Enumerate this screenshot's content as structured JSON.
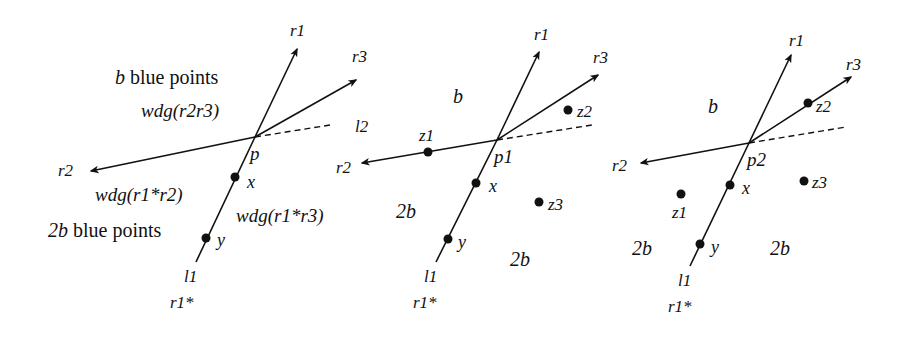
{
  "figure": {
    "background": "#ffffff",
    "ink": "#111111",
    "panels": [
      {
        "id": "panel-1",
        "apex": {
          "label": "p",
          "x": 255,
          "y": 137
        },
        "rays": [
          {
            "label": "r1",
            "tip": [
              297,
              49
            ]
          },
          {
            "label": "r3",
            "tip": [
              356,
              80
            ]
          },
          {
            "label": "r2",
            "tip": [
              91,
              171
            ]
          }
        ],
        "dashed": {
          "label": "l2",
          "end": [
            330,
            125
          ]
        },
        "line_l1": {
          "label": "l1",
          "end": [
            196,
            262
          ],
          "sub_label": "r1*"
        },
        "points": [
          {
            "label": "x",
            "x": 235,
            "y": 177
          },
          {
            "label": "y",
            "x": 206,
            "y": 238
          }
        ],
        "region_texts": [
          {
            "italic": "b",
            "text": " blue points",
            "x": 115,
            "y": 84
          },
          {
            "text": "wdg(r2r3)",
            "x": 141,
            "y": 117
          },
          {
            "text": "wdg(r1*r2)",
            "x": 95,
            "y": 201
          },
          {
            "italic": "2b",
            "text": " blue points",
            "x": 48,
            "y": 237
          },
          {
            "text": "wdg(r1*r3)",
            "x": 236,
            "y": 222
          }
        ]
      },
      {
        "id": "panel-2",
        "apex": {
          "label": "p1",
          "x": 497,
          "y": 140
        },
        "rays": [
          {
            "label": "r1",
            "tip": [
              539,
              52
            ]
          },
          {
            "label": "r3",
            "tip": [
              598,
              75
            ]
          },
          {
            "label": "r2",
            "tip": [
              362,
              163
            ]
          }
        ],
        "dashed": {
          "end": [
            592,
            125
          ]
        },
        "line_l1": {
          "label": "l1",
          "end": [
            436,
            262
          ],
          "sub_label": "r1*"
        },
        "points": [
          {
            "label": "x",
            "x": 476,
            "y": 183
          },
          {
            "label": "y",
            "x": 448,
            "y": 239
          },
          {
            "label": "z1",
            "x": 428,
            "y": 152
          },
          {
            "label": "z2",
            "x": 568,
            "y": 110
          },
          {
            "label": "z3",
            "x": 539,
            "y": 202
          }
        ],
        "region_texts": [
          {
            "text": "b",
            "x": 453,
            "y": 103
          },
          {
            "text": "2b",
            "x": 396,
            "y": 218
          },
          {
            "text": "2b",
            "x": 510,
            "y": 266
          }
        ]
      },
      {
        "id": "panel-3",
        "apex": {
          "label": "p2",
          "x": 749,
          "y": 143
        },
        "rays": [
          {
            "label": "r1",
            "tip": [
              791,
              55
            ]
          },
          {
            "label": "r3",
            "tip": [
              851,
              77
            ]
          },
          {
            "label": "r2",
            "tip": [
              641,
              163
            ]
          }
        ],
        "dashed": {
          "end": [
            846,
            127
          ]
        },
        "line_l1": {
          "label": "l1",
          "end": [
            690,
            266
          ],
          "sub_label": "r1*"
        },
        "points": [
          {
            "label": "x",
            "x": 730,
            "y": 185
          },
          {
            "label": "y",
            "x": 700,
            "y": 244
          },
          {
            "label": "z1",
            "x": 681,
            "y": 194
          },
          {
            "label": "z2",
            "x": 808,
            "y": 103
          },
          {
            "label": "z3",
            "x": 804,
            "y": 181
          }
        ],
        "region_texts": [
          {
            "text": "b",
            "x": 708,
            "y": 113
          },
          {
            "text": "2b",
            "x": 632,
            "y": 255
          },
          {
            "text": "2b",
            "x": 770,
            "y": 255
          }
        ]
      }
    ]
  },
  "labels": {
    "p1_r1": "r1",
    "p1_r2": "r2",
    "p1_r3": "r3",
    "p1_l2": "l2",
    "p1_p": "p",
    "p1_x": "x",
    "p1_y": "y",
    "p1_l1": "l1",
    "p1_r1star": "r1*",
    "p1_b": "b",
    "p1_blue1": " blue points",
    "p1_wdg23": "wdg(r2r3)",
    "p1_wdg12": "wdg(r1*r2)",
    "p1_2b": "2b",
    "p1_blue2": " blue points",
    "p1_wdg13": "wdg(r1*r3)",
    "p2_r1": "r1",
    "p2_r2": "r2",
    "p2_r3": "r3",
    "p2_p": "p1",
    "p2_x": "x",
    "p2_y": "y",
    "p2_z1": "z1",
    "p2_z2": "z2",
    "p2_z3": "z3",
    "p2_l1": "l1",
    "p2_r1star": "r1*",
    "p2_b": "b",
    "p2_2b_left": "2b",
    "p2_2b_right": "2b",
    "p3_r1": "r1",
    "p3_r2": "r2",
    "p3_r3": "r3",
    "p3_p": "p2",
    "p3_x": "x",
    "p3_y": "y",
    "p3_z1": "z1",
    "p3_z2": "z2",
    "p3_z3": "z3",
    "p3_l1": "l1",
    "p3_r1star": "r1*",
    "p3_b": "b",
    "p3_2b_left": "2b",
    "p3_2b_right": "2b"
  }
}
